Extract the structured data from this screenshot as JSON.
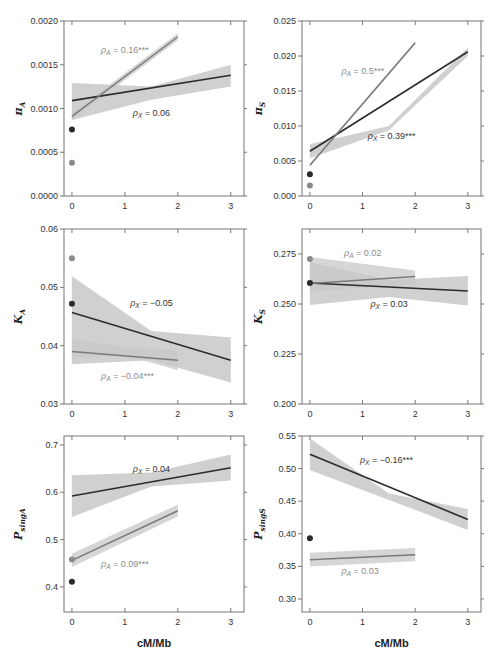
{
  "colors": {
    "x_line": "#2b2b2b",
    "a_line": "#7a7a7a",
    "x_point": "#2b2b2b",
    "a_point": "#8a8a8a",
    "band": "#c8c8c8",
    "frame": "#777777",
    "x_text": "#333333",
    "a_text": "#8a8a8a"
  },
  "chart_data": [
    {
      "id": "piA",
      "type": "line",
      "ylabel": "πA",
      "ylabel_main": "π",
      "ylabel_sub": "A",
      "xlabel": "",
      "xlim": [
        -0.15,
        3.25
      ],
      "ylim": [
        0.0,
        0.002
      ],
      "yticks": [
        0.0,
        0.0005,
        0.001,
        0.0015,
        0.002
      ],
      "ytick_labels": [
        "0.0000",
        "0.0005",
        "0.0010",
        "0.0015",
        "0.0020"
      ],
      "xticks": [
        0,
        1,
        2,
        3
      ],
      "xtick_labels": [
        "0",
        "1",
        "2",
        "3"
      ],
      "series": [
        {
          "name": "X",
          "x": [
            0,
            3
          ],
          "y": [
            0.00109,
            0.00138
          ],
          "band_lo": [
            0.00087,
            0.00125
          ],
          "band_hi": [
            0.00129,
            0.0015
          ],
          "band_mid_lo": 0.0011,
          "band_mid_hi": 0.00125,
          "point": 0.00076,
          "label": "ρX = 0.06",
          "label_pos": [
            1.15,
            0.00092
          ]
        },
        {
          "name": "A",
          "x": [
            0,
            2
          ],
          "y": [
            0.00091,
            0.00182
          ],
          "band_lo": [
            0.00087,
            0.00178
          ],
          "band_hi": [
            0.00095,
            0.00186
          ],
          "point": 0.00038,
          "label": "ρA = 0.16***",
          "label_pos": [
            0.55,
            0.00163
          ]
        }
      ]
    },
    {
      "id": "piS",
      "type": "line",
      "ylabel": "πS",
      "ylabel_main": "π",
      "ylabel_sub": "S",
      "xlabel": "",
      "xlim": [
        -0.15,
        3.25
      ],
      "ylim": [
        0.0,
        0.025
      ],
      "yticks": [
        0.0,
        0.005,
        0.01,
        0.015,
        0.02,
        0.025
      ],
      "ytick_labels": [
        "0.000",
        "0.005",
        "0.010",
        "0.015",
        "0.020",
        "0.025"
      ],
      "xticks": [
        0,
        1,
        2,
        3
      ],
      "xtick_labels": [
        "0",
        "1",
        "2",
        "3"
      ],
      "series": [
        {
          "name": "X",
          "x": [
            0,
            3
          ],
          "y": [
            0.0064,
            0.0206
          ],
          "band_lo": [
            0.0054,
            0.02
          ],
          "band_hi": [
            0.0074,
            0.0212
          ],
          "band_mid_lo": 0.0094,
          "band_mid_hi": 0.01,
          "point": 0.0031,
          "label": "ρX = 0.39***",
          "label_pos": [
            1.1,
            0.0082
          ]
        },
        {
          "name": "A",
          "x": [
            0,
            2
          ],
          "y": [
            0.0044,
            0.0219
          ],
          "band_lo": [
            0.0042,
            0.0217
          ],
          "band_hi": [
            0.0046,
            0.0221
          ],
          "point": 0.0015,
          "label": "ρA = 0.5***",
          "label_pos": [
            0.6,
            0.0174
          ]
        }
      ]
    },
    {
      "id": "KA",
      "type": "line",
      "ylabel": "KA",
      "ylabel_main": "K",
      "ylabel_sub": "A",
      "xlabel": "",
      "xlim": [
        -0.15,
        3.25
      ],
      "ylim": [
        0.03,
        0.06
      ],
      "yticks": [
        0.03,
        0.04,
        0.05,
        0.06
      ],
      "ytick_labels": [
        "0.03",
        "0.04",
        "0.05",
        "0.06"
      ],
      "xticks": [
        0,
        1,
        2,
        3
      ],
      "xtick_labels": [
        "0",
        "1",
        "2",
        "3"
      ],
      "series": [
        {
          "name": "X",
          "x": [
            0,
            3
          ],
          "y": [
            0.0457,
            0.0375
          ],
          "band_lo": [
            0.0368,
            0.0337
          ],
          "band_hi": [
            0.0519,
            0.0414
          ],
          "band_mid_lo": 0.0375,
          "band_mid_hi": 0.0425,
          "point": 0.0472,
          "label": "ρX = −0.05",
          "label_pos": [
            1.1,
            0.0468
          ]
        },
        {
          "name": "A",
          "x": [
            0,
            2
          ],
          "y": [
            0.039,
            0.0375
          ],
          "band_lo": [
            0.038,
            0.0358
          ],
          "band_hi": [
            0.0412,
            0.0392
          ],
          "band_mid_lo": 0.0384,
          "band_mid_hi": 0.0397,
          "point": 0.055,
          "label": "ρA = −0.04***",
          "label_pos": [
            0.55,
            0.0343
          ]
        }
      ]
    },
    {
      "id": "KS",
      "type": "line",
      "ylabel": "KS",
      "ylabel_main": "K",
      "ylabel_sub": "S",
      "xlabel": "",
      "xlim": [
        -0.15,
        3.25
      ],
      "ylim": [
        0.2,
        0.2875
      ],
      "yticks": [
        0.2,
        0.225,
        0.25,
        0.275
      ],
      "ytick_labels": [
        "0.200",
        "0.225",
        "0.250",
        "0.275"
      ],
      "xticks": [
        0,
        1,
        2,
        3
      ],
      "xtick_labels": [
        "0",
        "1",
        "2",
        "3"
      ],
      "series": [
        {
          "name": "X",
          "x": [
            0,
            3
          ],
          "y": [
            0.2605,
            0.2565
          ],
          "band_lo": [
            0.2495,
            0.2493
          ],
          "band_hi": [
            0.271,
            0.264
          ],
          "band_mid_lo": 0.2535,
          "band_mid_hi": 0.262,
          "point": 0.2605,
          "label": "ρX = 0.03",
          "label_pos": [
            1.15,
            0.2485
          ]
        },
        {
          "name": "A",
          "x": [
            0,
            2
          ],
          "y": [
            0.2603,
            0.2637
          ],
          "band_lo": [
            0.2563,
            0.26
          ],
          "band_hi": [
            0.2735,
            0.2668
          ],
          "point": 0.2725,
          "label": "ρA = 0.02",
          "label_pos": [
            0.65,
            0.2738
          ]
        }
      ]
    },
    {
      "id": "PsingA",
      "type": "line",
      "ylabel": "PsingA",
      "ylabel_main": "P",
      "ylabel_sub": "singA",
      "xlabel": "cM/Mb",
      "xlim": [
        -0.15,
        3.25
      ],
      "ylim": [
        0.347,
        0.719
      ],
      "yticks": [
        0.4,
        0.5,
        0.6,
        0.7
      ],
      "ytick_labels": [
        "0.4",
        "0.5",
        "0.6",
        "0.7"
      ],
      "xticks": [
        0,
        1,
        2,
        3
      ],
      "xtick_labels": [
        "0",
        "1",
        "2",
        "3"
      ],
      "series": [
        {
          "name": "X",
          "x": [
            0,
            3
          ],
          "y": [
            0.592,
            0.652
          ],
          "band_lo": [
            0.548,
            0.625
          ],
          "band_hi": [
            0.636,
            0.68
          ],
          "band_mid_lo": 0.612,
          "band_mid_hi": 0.642,
          "point": 0.411,
          "label": "ρX = 0.04",
          "label_pos": [
            1.15,
            0.642
          ]
        },
        {
          "name": "A",
          "x": [
            0,
            2
          ],
          "y": [
            0.456,
            0.561
          ],
          "band_lo": [
            0.442,
            0.549
          ],
          "band_hi": [
            0.47,
            0.574
          ],
          "point": 0.458,
          "label": "ρA = 0.09***",
          "label_pos": [
            0.55,
            0.443
          ]
        }
      ]
    },
    {
      "id": "PsingS",
      "type": "line",
      "ylabel": "PsingS",
      "ylabel_main": "P",
      "ylabel_sub": "singS",
      "xlabel": "cM/Mb",
      "xlim": [
        -0.15,
        3.25
      ],
      "ylim": [
        0.28,
        0.55
      ],
      "yticks": [
        0.3,
        0.35,
        0.4,
        0.45,
        0.5,
        0.55
      ],
      "ytick_labels": [
        "0.30",
        "0.35",
        "0.40",
        "0.45",
        "0.50",
        "0.55"
      ],
      "xticks": [
        0,
        1,
        2,
        3
      ],
      "xtick_labels": [
        "0",
        "1",
        "2",
        "3"
      ],
      "series": [
        {
          "name": "X",
          "x": [
            0,
            3
          ],
          "y": [
            0.522,
            0.422
          ],
          "band_lo": [
            0.498,
            0.406
          ],
          "band_hi": [
            0.546,
            0.438
          ],
          "band_mid_lo": 0.452,
          "band_mid_hi": 0.462,
          "point": 0.393,
          "label": "ρX = −0.16***",
          "label_pos": [
            0.95,
            0.508
          ]
        },
        {
          "name": "A",
          "x": [
            0,
            2
          ],
          "y": [
            0.36,
            0.368
          ],
          "band_lo": [
            0.35,
            0.358
          ],
          "band_hi": [
            0.371,
            0.378
          ],
          "point": null,
          "label": "ρA = 0.03",
          "label_pos": [
            0.6,
            0.338
          ]
        }
      ]
    }
  ]
}
